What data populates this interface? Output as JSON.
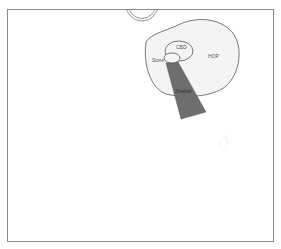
{
  "diagram": {
    "type": "spatial-zone-diagram",
    "frame": {
      "x": 7,
      "y": 9,
      "width": 267,
      "height": 233,
      "stroke": "#8a8a8a"
    },
    "top_circle": {
      "cx": 142,
      "cy": 5,
      "r": 16,
      "stroke": "#8a8a8a"
    },
    "regions": {
      "hop": {
        "label": "HOP",
        "fill": "#f0f0f0",
        "stroke": "#555555"
      },
      "cbd": {
        "label": "CBD",
        "stroke": "#555555"
      },
      "store": {
        "label": "Store",
        "stroke": "#555555"
      },
      "shadow": {
        "label": "Shadow",
        "fill": "#6e6e6e"
      }
    },
    "faint_mark": {
      "x": 225,
      "y": 145
    }
  }
}
